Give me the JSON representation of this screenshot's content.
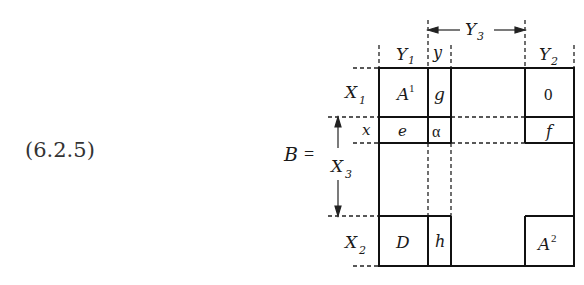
{
  "equation_number": "(6.2.5)",
  "matrix_name": "B",
  "equals": "=",
  "column_labels": {
    "Y1": {
      "base": "Y",
      "sub": "1"
    },
    "y": {
      "base": "y"
    },
    "Y3": {
      "base": "Y",
      "sub": "3"
    },
    "Y2": {
      "base": "Y",
      "sub": "2"
    }
  },
  "row_labels": {
    "X1": {
      "base": "X",
      "sub": "1"
    },
    "x": {
      "base": "x"
    },
    "X3": {
      "base": "X",
      "sub": "3"
    },
    "X2": {
      "base": "X",
      "sub": "2"
    }
  },
  "blocks": {
    "A1": {
      "base": "A",
      "sup": "1"
    },
    "g": "g",
    "zero": "0",
    "e": "e",
    "alpha": "α",
    "f": "f",
    "D": "D",
    "h": "h",
    "A2": {
      "base": "A",
      "sup": "2"
    }
  }
}
